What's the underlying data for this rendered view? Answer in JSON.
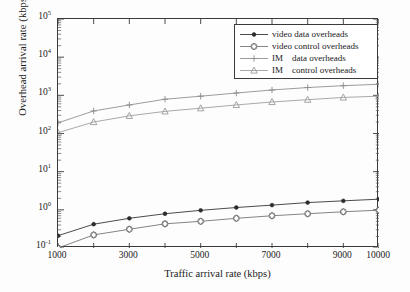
{
  "chart_data": {
    "type": "line",
    "title": "",
    "xlabel": "Traffic arrival rate (kbps)",
    "ylabel": "Overhead arrival rate (kbps)",
    "xscale": "linear",
    "yscale": "log",
    "xlim": [
      1000,
      10000
    ],
    "ylim": [
      0.1,
      100000
    ],
    "grid": false,
    "legend_position": "upper right",
    "xticks": [
      1000,
      2000,
      3000,
      4000,
      5000,
      6000,
      7000,
      8000,
      9000,
      10000
    ],
    "xticklabels": [
      "1000",
      "",
      "3000",
      "",
      "5000",
      "",
      "7000",
      "",
      "9000",
      "10000"
    ],
    "yticks": [
      0.1,
      1,
      10,
      100,
      1000,
      10000,
      100000
    ],
    "yticklabels": [
      "10-1",
      "100",
      "101",
      "102",
      "103",
      "104",
      "105"
    ],
    "yticklabels_mantissa": [
      "10",
      "10",
      "10",
      "10",
      "10",
      "10",
      "10"
    ],
    "yticklabels_exponent": [
      "-1",
      "0",
      "1",
      "2",
      "3",
      "4",
      "5"
    ],
    "x": [
      1000,
      2000,
      3000,
      4000,
      5000,
      6000,
      7000,
      8000,
      9000,
      10000
    ],
    "series": [
      {
        "name": "video data overheads",
        "marker": "filled-circle",
        "color": "#2b2b2b",
        "values": [
          0.21,
          0.42,
          0.6,
          0.79,
          0.97,
          1.15,
          1.33,
          1.55,
          1.72,
          1.9
        ]
      },
      {
        "name": "video control overheads",
        "marker": "open-diamond",
        "color": "#6e6e6e",
        "values": [
          0.1,
          0.22,
          0.31,
          0.43,
          0.5,
          0.6,
          0.7,
          0.79,
          0.89,
          0.98
        ]
      },
      {
        "name": "IM    data overheads",
        "marker": "plus",
        "color": "#8a8a8a",
        "values": [
          190,
          390,
          560,
          790,
          950,
          1150,
          1380,
          1600,
          1790,
          1950
        ]
      },
      {
        "name": "IM    control overheads",
        "marker": "open-triangle",
        "color": "#9a9a9a",
        "values": [
          105,
          200,
          290,
          380,
          460,
          560,
          670,
          770,
          880,
          950
        ]
      }
    ]
  },
  "legend": {
    "items": [
      {
        "label": "video data overheads",
        "marker": "filled-circle"
      },
      {
        "label": "video control overheads",
        "marker": "open-diamond"
      },
      {
        "label": "IM    data overheads",
        "marker": "plus"
      },
      {
        "label": "IM    control overheads",
        "marker": "open-triangle"
      }
    ]
  },
  "axes": {
    "x_title": "Traffic arrival rate (kbps)",
    "y_title": "Overhead arrival rate (kbps)"
  }
}
